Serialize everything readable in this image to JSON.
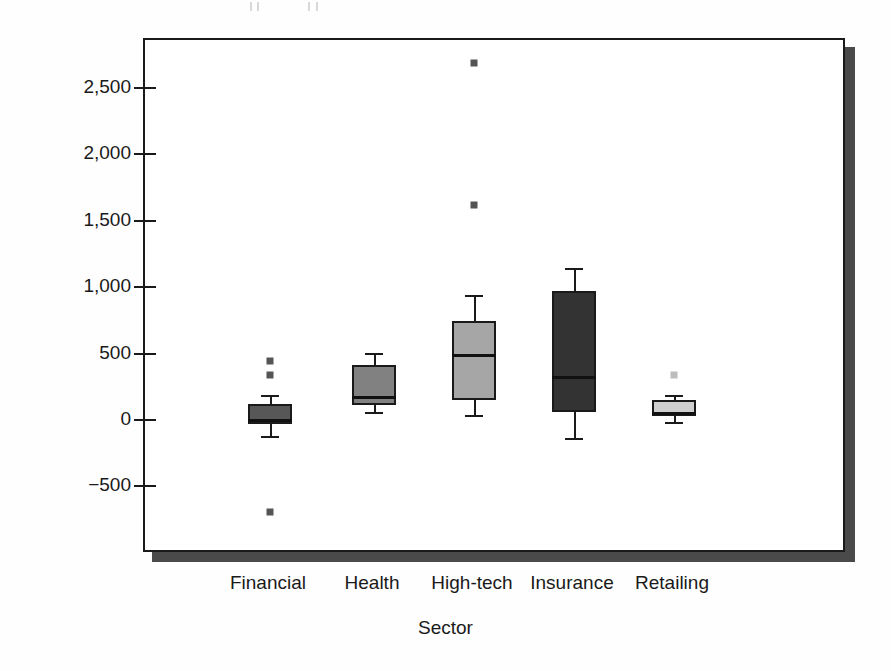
{
  "chart_data": {
    "type": "box",
    "title": "",
    "xlabel": "Sector",
    "ylabel": "Net profits ($, millions)",
    "ylim": [
      -950,
      2900
    ],
    "yticks": [
      -500,
      0,
      500,
      1000,
      1500,
      2000,
      2500
    ],
    "ytick_labels": [
      "−500",
      "0",
      "500",
      "1,000",
      "1,500",
      "2,000",
      "2,500"
    ],
    "grid": false,
    "legend": "none",
    "categories": [
      "Financial",
      "Health",
      "High-tech",
      "Insurance",
      "Retailing"
    ],
    "boxes": [
      {
        "category": "Financial",
        "whisker_low": -125,
        "q1": -40,
        "median": 0,
        "q3": 110,
        "whisker_high": 180,
        "outliers": [
          440,
          330,
          -700
        ],
        "fill": "#575757"
      },
      {
        "category": "Health",
        "whisker_low": 55,
        "q1": 105,
        "median": 175,
        "q3": 405,
        "whisker_high": 495,
        "outliers": [],
        "fill": "#818181"
      },
      {
        "category": "High-tech",
        "whisker_low": 30,
        "q1": 140,
        "median": 490,
        "q3": 740,
        "whisker_high": 935,
        "outliers": [
          2680,
          1610
        ],
        "fill": "#a6a6a6"
      },
      {
        "category": "Insurance",
        "whisker_low": -145,
        "q1": 50,
        "median": 325,
        "q3": 965,
        "whisker_high": 1140,
        "outliers": [],
        "fill": "#333333"
      },
      {
        "category": "Retailing",
        "whisker_low": -20,
        "q1": 25,
        "median": 50,
        "q3": 140,
        "whisker_high": 180,
        "outliers": [
          330
        ],
        "fill": "#cfcfcf"
      }
    ],
    "colors": {
      "axis": "#1a1a1a",
      "frame": "#1a1a1a",
      "shadow": "#4a4a4a",
      "background": "#ffffff",
      "outlier": "#555555"
    }
  }
}
